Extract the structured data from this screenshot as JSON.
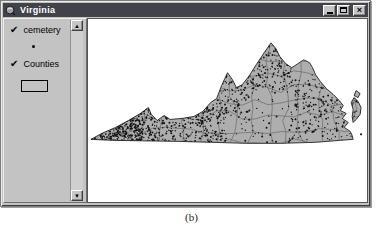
{
  "window": {
    "title": "Virginia"
  },
  "icons": {
    "check": "✔",
    "scroll_up": "▲",
    "scroll_down": "▼",
    "close": "×"
  },
  "toc": {
    "layers": [
      {
        "label": "cemetery",
        "checked": true,
        "symbol": "point-dot"
      },
      {
        "label": "Counties",
        "checked": true,
        "symbol": "rectangle-outline"
      }
    ]
  },
  "map": {
    "region": "Virginia",
    "county_mesh": {
      "col_step": 13,
      "row_step": 11,
      "jitter": 4.5
    },
    "dot_clusters": [
      {
        "name": "southwest-dense",
        "x": [
          2,
          90
        ],
        "y": [
          86,
          126
        ],
        "count": 500
      },
      {
        "name": "southwest-tip",
        "x": [
          2,
          55
        ],
        "y": [
          100,
          125
        ],
        "count": 250
      },
      {
        "name": "central-south",
        "x": [
          92,
          140
        ],
        "y": [
          88,
          124
        ],
        "count": 170
      },
      {
        "name": "blue-ridge",
        "x": [
          126,
          162
        ],
        "y": [
          56,
          100
        ],
        "count": 120
      },
      {
        "name": "northern",
        "x": [
          158,
          205
        ],
        "y": [
          26,
          72
        ],
        "count": 170
      },
      {
        "name": "eastern",
        "x": [
          205,
          268
        ],
        "y": [
          60,
          122
        ],
        "count": 210
      },
      {
        "name": "statewide",
        "x": [
          2,
          268
        ],
        "y": [
          22,
          126
        ],
        "count": 330
      },
      {
        "name": "eastern-shore",
        "x": [
          265,
          277
        ],
        "y": [
          71,
          106
        ],
        "count": 35
      }
    ]
  },
  "caption": "(b)",
  "colors": {
    "titlebar": "#42424a",
    "windowbg": "#c3c3c3",
    "mapbg": "#ffffff",
    "statefill": "#aeaeae",
    "countyline": "#646464",
    "dots": "#141414"
  }
}
